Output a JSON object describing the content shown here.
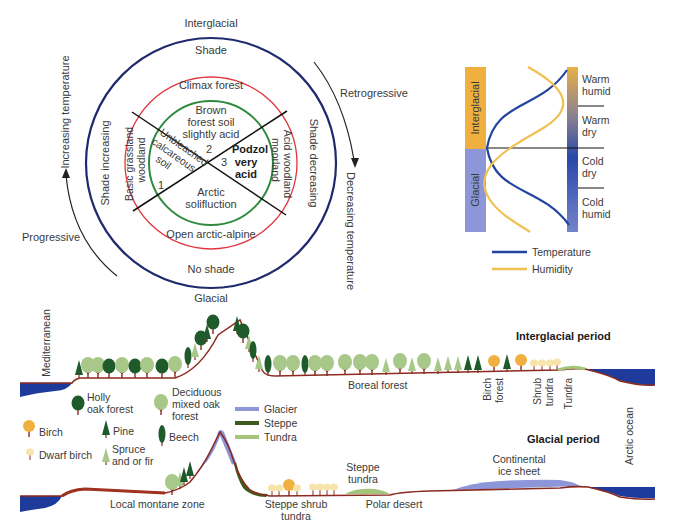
{
  "cycle_diagram": {
    "top": "Interglacial",
    "bottom": "Glacial",
    "outer_ring": {
      "top": "Shade",
      "bottom": "No shade",
      "left": "Shade increasing",
      "right": "Shade decreasing"
    },
    "middle_ring": {
      "top": "Climax forest",
      "bottom": "Open arctic-alpine",
      "left_line1": "Basic grassland",
      "left_line2": "woodland",
      "right_line1": "Acid woodland",
      "right_line2": "moorland"
    },
    "inner": {
      "top_line1": "Brown",
      "top_line2": "forest soil",
      "top_line3": "slightly acid",
      "top_num": "2",
      "left_line1": "Unbleached",
      "left_line2": "calcareous",
      "left_line3": "soil",
      "left_num": "1",
      "right_line1": "Podzol",
      "right_line2": "very",
      "right_line3": "acid",
      "right_num": "3",
      "bottom_line1": "Arctic",
      "bottom_line2": "solifluction"
    },
    "arrows": {
      "left_label": "Progressive",
      "left_axis": "Increasing temperature",
      "right_label": "Retrogressive",
      "right_axis": "Decreasing temperature"
    },
    "colors": {
      "outer": "#1f2a6e",
      "middle": "#e0363e",
      "inner": "#2e8b3e"
    }
  },
  "climate_chart": {
    "left_bar": {
      "top": "Interglacial",
      "bottom": "Glacial"
    },
    "right_labels": [
      {
        "line1": "Warm",
        "line2": "humid"
      },
      {
        "line1": "Warm",
        "line2": "dry"
      },
      {
        "line1": "Cold",
        "line2": "dry"
      },
      {
        "line1": "Cold",
        "line2": "humid"
      }
    ],
    "legend": [
      {
        "label": "Temperature",
        "color": "#2244a0"
      },
      {
        "label": "Humidity",
        "color": "#f0c050"
      }
    ],
    "colors": {
      "interglacial": "#f0b040",
      "glacial": "#8c96d8"
    }
  },
  "landscape": {
    "interglacial_title": "Interglacial period",
    "glacial_title": "Glacial period",
    "mediterranean": "Mediterranean",
    "arctic_ocean": "Arctic ocean",
    "interglacial_labels": {
      "boreal": "Boreal forest",
      "birch_forest_1": "Birch",
      "birch_forest_2": "forest",
      "shrub_tundra_1": "Shrub",
      "shrub_tundra_2": "tundra",
      "tundra": "Tundra"
    },
    "glacial_labels": {
      "montane": "Local montane zone",
      "steppe_shrub_1": "Steppe shrub",
      "steppe_shrub_2": "tundra",
      "steppe_tundra_1": "Steppe",
      "steppe_tundra_2": "tundra",
      "polar_desert": "Polar desert",
      "ice_sheet_1": "Continental",
      "ice_sheet_2": "ice sheet"
    },
    "legend": {
      "holly_1": "Holly",
      "holly_2": "oak forest",
      "deciduous_1": "Deciduous",
      "deciduous_2": "mixed oak",
      "deciduous_3": "forest",
      "birch": "Birch",
      "pine": "Pine",
      "beech": "Beech",
      "dwarf_birch": "Dwarf birch",
      "spruce_1": "Spruce",
      "spruce_2": "and or fir",
      "glacier": "Glacier",
      "steppe": "Steppe",
      "tundra": "Tundra"
    },
    "colors": {
      "glacier": "#8c96d8",
      "steppe": "#3d5a1e",
      "tundra": "#a4c47a",
      "ocean": "#1e3a9a",
      "ground": "#8b2a20",
      "dark_tree": "#1f5a2a",
      "light_tree": "#a8c88a",
      "birch": "#f0b040",
      "dwarf_birch": "#f6e4a8"
    }
  }
}
